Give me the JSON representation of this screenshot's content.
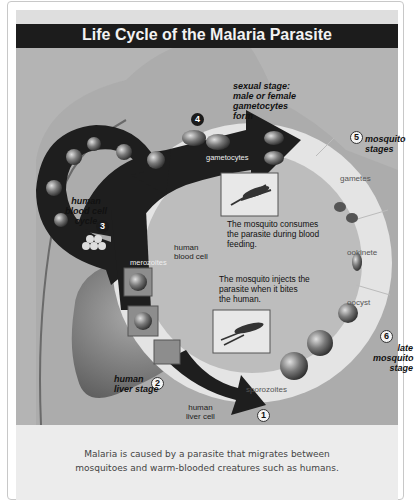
{
  "figure": {
    "title": "Life Cycle of the Malaria Parasite",
    "stages": [
      {
        "number": "1",
        "label": ""
      },
      {
        "number": "2",
        "label": "human liver stage",
        "lines": [
          "human",
          "liver stage"
        ]
      },
      {
        "number": "3",
        "label": "human blood cell cycle",
        "lines": [
          "human",
          "blood cell",
          "cycle"
        ]
      },
      {
        "number": "4",
        "label": "sexual stage: male or female gametocytes form",
        "lines": [
          "sexual stage:",
          "male or female",
          "gametocytes",
          "form"
        ]
      },
      {
        "number": "5",
        "label": "mosquito stages",
        "lines": [
          "mosquito",
          "stages"
        ]
      },
      {
        "number": "6",
        "label": "late mosquito stage",
        "lines": [
          "late",
          "mosquito",
          "stage"
        ]
      }
    ],
    "labels": {
      "gametocytes": "gametocytes",
      "gametes": "gametes",
      "ookinete": "ookinete",
      "oocyst": "oocyst",
      "sporozoites": "sporozoites",
      "merozoites": "merozoites",
      "human_blood_cell": [
        "human",
        "blood cell"
      ],
      "human_liver_cell": [
        "human",
        "liver cell"
      ]
    },
    "notes": {
      "consume": [
        "The mosquito consumes",
        "the parasite during blood",
        "feeding."
      ],
      "inject": [
        "The mosquito injects the",
        "parasite when it bites",
        "the human."
      ]
    },
    "colors": {
      "title_bar": "#1c1c1c",
      "arrow": "#1e1e1e",
      "ring": "#e6e6e6",
      "background": "#b4b4b4"
    }
  },
  "caption": {
    "lines": [
      "Malaria is caused by a parasite that migrates between",
      "mosquitoes and warm-blooded creatures such as humans."
    ]
  }
}
